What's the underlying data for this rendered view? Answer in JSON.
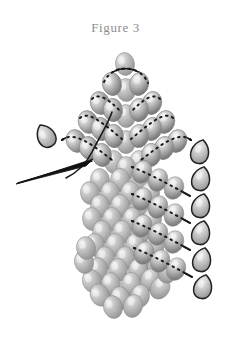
{
  "figure": {
    "caption": "Figure 3",
    "background_color": "#ffffff",
    "caption_color": "#8d8d8d"
  },
  "palette": {
    "bead_light": "#e8e8e8",
    "bead_mid": "#a8a8a8",
    "bead_dark": "#6e6e6e",
    "bead_outline": "#8a8a8a",
    "thread_color": "#1a1a1a",
    "needle_color": "#111111",
    "loop_bead_outline": "#222222"
  },
  "geometry": {
    "width": 231,
    "height": 339,
    "apex": {
      "x": 125,
      "y": 64
    },
    "bead_rx": 9.5,
    "bead_ry": 11.5,
    "row_spacing_y": 26.5,
    "column_spacing_x": 20,
    "diagonal_slope": 0.62
  },
  "structure": {
    "description": "Gray oval beads arranged in a chevron / triangular fan with diagonal strung rows radiating from an apex, a plain field of beads at left-center, and teardrop turn-beads at the ends of each strung row.",
    "apex_bead_count": 1,
    "diagonal_rows": 7,
    "left_field_columns": 4,
    "turn_beads_right": 6,
    "turn_beads_left": 1
  },
  "plain_beads": [
    {
      "x": 125,
      "y": 64,
      "r": -8
    },
    {
      "x": 112,
      "y": 84,
      "r": -14
    },
    {
      "x": 139,
      "y": 84,
      "r": 12
    },
    {
      "x": 126,
      "y": 90,
      "r": -4
    },
    {
      "x": 100,
      "y": 103,
      "r": -18
    },
    {
      "x": 152,
      "y": 103,
      "r": 16
    },
    {
      "x": 113,
      "y": 110,
      "r": -8
    },
    {
      "x": 139,
      "y": 110,
      "r": 8
    },
    {
      "x": 126,
      "y": 116,
      "r": -3
    },
    {
      "x": 88,
      "y": 122,
      "r": -20
    },
    {
      "x": 165,
      "y": 122,
      "r": 18
    },
    {
      "x": 101,
      "y": 129,
      "r": -12
    },
    {
      "x": 152,
      "y": 129,
      "r": 12
    },
    {
      "x": 114,
      "y": 136,
      "r": -6
    },
    {
      "x": 139,
      "y": 136,
      "r": 6
    },
    {
      "x": 126,
      "y": 142,
      "r": 0
    },
    {
      "x": 76,
      "y": 141,
      "r": -22
    },
    {
      "x": 177,
      "y": 141,
      "r": 20
    },
    {
      "x": 89,
      "y": 148,
      "r": -14
    },
    {
      "x": 164,
      "y": 148,
      "r": 14
    },
    {
      "x": 102,
      "y": 155,
      "r": -8
    },
    {
      "x": 151,
      "y": 155,
      "r": 8
    },
    {
      "x": 114,
      "y": 162,
      "r": -4
    },
    {
      "x": 139,
      "y": 162,
      "r": 4
    },
    {
      "x": 126,
      "y": 168,
      "r": 0
    },
    {
      "x": 100,
      "y": 180,
      "r": -6
    },
    {
      "x": 120,
      "y": 180,
      "r": -2
    },
    {
      "x": 140,
      "y": 180,
      "r": 4
    },
    {
      "x": 90,
      "y": 193,
      "r": -8
    },
    {
      "x": 110,
      "y": 193,
      "r": -3
    },
    {
      "x": 130,
      "y": 193,
      "r": 2
    },
    {
      "x": 150,
      "y": 193,
      "r": 7
    },
    {
      "x": 100,
      "y": 206,
      "r": -5
    },
    {
      "x": 120,
      "y": 206,
      "r": 0
    },
    {
      "x": 140,
      "y": 206,
      "r": 4
    },
    {
      "x": 92,
      "y": 219,
      "r": -7
    },
    {
      "x": 112,
      "y": 219,
      "r": -2
    },
    {
      "x": 132,
      "y": 219,
      "r": 3
    },
    {
      "x": 152,
      "y": 219,
      "r": 8
    },
    {
      "x": 102,
      "y": 232,
      "r": -4
    },
    {
      "x": 122,
      "y": 232,
      "r": 1
    },
    {
      "x": 142,
      "y": 232,
      "r": 5
    },
    {
      "x": 95,
      "y": 245,
      "r": -6
    },
    {
      "x": 115,
      "y": 245,
      "r": -1
    },
    {
      "x": 135,
      "y": 245,
      "r": 4
    },
    {
      "x": 155,
      "y": 245,
      "r": 8
    },
    {
      "x": 105,
      "y": 258,
      "r": -3
    },
    {
      "x": 125,
      "y": 258,
      "r": 1
    },
    {
      "x": 145,
      "y": 258,
      "r": 6
    },
    {
      "x": 98,
      "y": 269,
      "r": -10
    },
    {
      "x": 118,
      "y": 270,
      "r": -2
    },
    {
      "x": 138,
      "y": 270,
      "r": 5
    },
    {
      "x": 157,
      "y": 267,
      "r": 12
    },
    {
      "x": 92,
      "y": 281,
      "r": -16
    },
    {
      "x": 111,
      "y": 284,
      "r": -6
    },
    {
      "x": 131,
      "y": 284,
      "r": 4
    },
    {
      "x": 150,
      "y": 280,
      "r": 16
    },
    {
      "x": 100,
      "y": 295,
      "r": -26
    },
    {
      "x": 120,
      "y": 298,
      "r": -6
    },
    {
      "x": 140,
      "y": 296,
      "r": 10
    },
    {
      "x": 113,
      "y": 307,
      "r": -14
    },
    {
      "x": 133,
      "y": 306,
      "r": 14
    },
    {
      "x": 160,
      "y": 288,
      "r": 30
    },
    {
      "x": 168,
      "y": 272,
      "r": 24
    },
    {
      "x": 84,
      "y": 262,
      "r": -14
    },
    {
      "x": 86,
      "y": 248,
      "r": -10
    }
  ],
  "strung_rows": [
    {
      "name": "apex-arc",
      "beads": [
        {
          "x": 112,
          "y": 84,
          "r": -14
        },
        {
          "x": 139,
          "y": 84,
          "r": 12
        }
      ],
      "thread": "M 104 82 C 112 64, 140 64, 148 83"
    },
    {
      "name": "row-left-1",
      "beads": [
        {
          "x": 100,
          "y": 103,
          "r": -18
        },
        {
          "x": 113,
          "y": 110,
          "r": -8
        }
      ],
      "thread": "M 92 99 C 98 92, 110 100, 121 112"
    },
    {
      "name": "row-right-1",
      "beads": [
        {
          "x": 152,
          "y": 103,
          "r": 16
        },
        {
          "x": 139,
          "y": 110,
          "r": 8
        }
      ],
      "thread": "M 160 99 C 154 92, 142 100, 131 112"
    },
    {
      "name": "row-left-2",
      "beads": [
        {
          "x": 88,
          "y": 122,
          "r": -20
        },
        {
          "x": 101,
          "y": 129,
          "r": -12
        },
        {
          "x": 114,
          "y": 136,
          "r": -6
        }
      ],
      "thread": "M 80 118 C 88 110, 104 124, 122 139"
    },
    {
      "name": "row-right-2",
      "beads": [
        {
          "x": 165,
          "y": 122,
          "r": 18
        },
        {
          "x": 152,
          "y": 129,
          "r": 12
        },
        {
          "x": 139,
          "y": 136,
          "r": 6
        }
      ],
      "thread": "M 173 118 C 165 110, 149 124, 131 139"
    },
    {
      "name": "row-left-3",
      "beads": [
        {
          "x": 76,
          "y": 141,
          "r": -22
        },
        {
          "x": 89,
          "y": 148,
          "r": -14
        },
        {
          "x": 102,
          "y": 155,
          "r": -8
        }
      ],
      "thread": "M 62 140 C 74 130, 94 146, 112 160"
    },
    {
      "name": "row-right-3",
      "beads": [
        {
          "x": 177,
          "y": 141,
          "r": 20
        },
        {
          "x": 164,
          "y": 148,
          "r": 14
        },
        {
          "x": 151,
          "y": 155,
          "r": 8
        }
      ],
      "thread": "M 191 140 C 179 130, 159 146, 141 160"
    },
    {
      "name": "row-right-4",
      "beads": [
        {
          "x": 142,
          "y": 172,
          "r": 22
        },
        {
          "x": 158,
          "y": 180,
          "r": 22
        },
        {
          "x": 174,
          "y": 188,
          "r": 22
        }
      ],
      "thread": "M 132 167 C 150 174, 172 186, 190 196"
    },
    {
      "name": "row-right-5",
      "beads": [
        {
          "x": 142,
          "y": 199,
          "r": 22
        },
        {
          "x": 158,
          "y": 207,
          "r": 22
        },
        {
          "x": 174,
          "y": 215,
          "r": 22
        }
      ],
      "thread": "M 132 194 C 150 201, 172 213, 190 223"
    },
    {
      "name": "row-right-6",
      "beads": [
        {
          "x": 142,
          "y": 226,
          "r": 22
        },
        {
          "x": 158,
          "y": 234,
          "r": 22
        },
        {
          "x": 174,
          "y": 242,
          "r": 22
        }
      ],
      "thread": "M 132 221 C 150 228, 172 240, 190 250"
    },
    {
      "name": "row-right-7",
      "beads": [
        {
          "x": 144,
          "y": 253,
          "r": 22
        },
        {
          "x": 160,
          "y": 261,
          "r": 22
        },
        {
          "x": 176,
          "y": 269,
          "r": 22
        }
      ],
      "thread": "M 134 248 C 152 255, 174 267, 192 277"
    }
  ],
  "turn_beads": [
    {
      "name": "turn-bead-left",
      "x": 46,
      "y": 136,
      "r": -28
    },
    {
      "name": "turn-bead-right-1",
      "x": 200,
      "y": 152,
      "r": 14
    },
    {
      "name": "turn-bead-right-2",
      "x": 201,
      "y": 179,
      "r": 14
    },
    {
      "name": "turn-bead-right-3",
      "x": 201,
      "y": 206,
      "r": 14
    },
    {
      "name": "turn-bead-right-4",
      "x": 201,
      "y": 233,
      "r": 14
    },
    {
      "name": "turn-bead-right-5",
      "x": 202,
      "y": 260,
      "r": 14
    },
    {
      "name": "turn-bead-right-6",
      "x": 203,
      "y": 287,
      "r": 14
    }
  ],
  "working_thread": {
    "name": "working-thread",
    "path": "M 112 112 C 108 124, 98 140, 92 152 C 86 164, 78 172, 66 178"
  },
  "needle": {
    "name": "beading-needle",
    "tip": {
      "x": 16,
      "y": 184
    },
    "eye": {
      "x": 92,
      "y": 160
    },
    "path": "M 16 184 L 93 159 L 86 166 Z",
    "shaft": "M 18 183 L 92 161"
  }
}
